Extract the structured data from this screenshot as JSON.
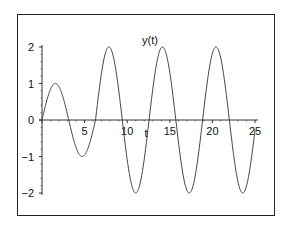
{
  "chart_data": {
    "type": "line",
    "title": "y(t)",
    "xlabel": "t",
    "ylabel": "",
    "xlim": [
      0,
      25
    ],
    "ylim": [
      -2,
      2
    ],
    "x_ticks": [
      0,
      5,
      10,
      15,
      20,
      25
    ],
    "x_tick_labels": [
      "5",
      "10",
      "15",
      "20",
      "25"
    ],
    "y_ticks": [
      -2,
      -1,
      0,
      1,
      2
    ],
    "y_tick_labels": [
      "2",
      "1",
      "0",
      "−1",
      "−2"
    ],
    "grid": false,
    "legend": null,
    "series": [
      {
        "name": "y(t)",
        "description": "sin(t) for 0 ≤ t < 2π; 2·sin(t) for t ≥ 2π",
        "x": [
          0,
          1.571,
          3.142,
          4.712,
          6.283,
          7.854,
          9.425,
          10.996,
          12.566,
          14.137,
          15.708,
          17.279,
          18.85,
          20.42,
          21.991,
          23.562,
          25
        ],
        "values": [
          0,
          1,
          0,
          -1,
          0,
          2,
          0,
          -2,
          0,
          2,
          0,
          -2,
          0,
          2,
          0,
          -2,
          -0.26
        ]
      }
    ],
    "colors": {
      "line": "#444444",
      "axes": "#333333",
      "frame": "#222222"
    }
  }
}
